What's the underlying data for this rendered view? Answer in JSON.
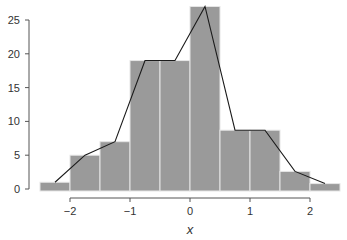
{
  "chart_data": {
    "type": "bar",
    "subtype": "histogram_with_frequency_polygon",
    "title": "",
    "xlabel": "x",
    "ylabel": "",
    "xlim": [
      -2.5,
      2.5
    ],
    "ylim": [
      0,
      27
    ],
    "bin_width": 0.5,
    "bin_edges": [
      -2.5,
      -2.0,
      -1.5,
      -1.0,
      -0.5,
      0.0,
      0.5,
      1.0,
      1.5,
      2.0,
      2.5
    ],
    "categories": [
      "[-2.5,-2)",
      "[-2,-1.5)",
      "[-1.5,-1)",
      "[-1,-0.5)",
      "[-0.5,0)",
      "[0,0.5)",
      "[0.5,1)",
      "[1,1.5)",
      "[1.5,2)",
      "[2,2.5)"
    ],
    "values": [
      1,
      5,
      7,
      19,
      19,
      27,
      8.7,
      8.7,
      2.6,
      0.8
    ],
    "series": [
      {
        "name": "histogram",
        "values": [
          1,
          5,
          7,
          19,
          19,
          27,
          8.7,
          8.7,
          2.6,
          0.8
        ]
      },
      {
        "name": "frequency polygon",
        "x": [
          -2.25,
          -1.75,
          -1.25,
          -0.75,
          -0.25,
          0.25,
          0.75,
          1.25,
          1.75,
          2.25
        ],
        "values": [
          1,
          5,
          7,
          19,
          19,
          27,
          8.7,
          8.7,
          2.6,
          0.8
        ]
      }
    ],
    "x_ticks": [
      -2,
      -1,
      0,
      1,
      2
    ],
    "x_tick_labels": [
      "−2",
      "−1",
      "0",
      "1",
      "2"
    ],
    "y_ticks": [
      0,
      5,
      10,
      15,
      20,
      25
    ],
    "y_tick_labels": [
      "0",
      "5",
      "10",
      "15",
      "20",
      "25"
    ],
    "grid": false,
    "legend": "none",
    "colors": {
      "bar": "#9a9a9a",
      "bar_edge": "#e6e6e6",
      "line": "#1a1a1a",
      "axis": "#555555"
    }
  }
}
